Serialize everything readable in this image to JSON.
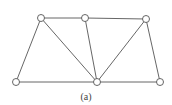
{
  "diagram": {
    "caption": "(a)",
    "colors": {
      "stroke": "#555555",
      "node_fill": "#ffffff",
      "background": "#ffffff"
    },
    "node_radius": 3.5,
    "nodes": [
      {
        "id": "n1",
        "x": 41,
        "y": 18
      },
      {
        "id": "n2",
        "x": 85,
        "y": 18
      },
      {
        "id": "n3",
        "x": 146,
        "y": 19
      },
      {
        "id": "n4",
        "x": 16,
        "y": 82
      },
      {
        "id": "n5",
        "x": 97,
        "y": 82
      },
      {
        "id": "n6",
        "x": 160,
        "y": 82
      }
    ],
    "edges": [
      [
        "n1",
        "n2"
      ],
      [
        "n2",
        "n3"
      ],
      [
        "n4",
        "n5"
      ],
      [
        "n5",
        "n6"
      ],
      [
        "n1",
        "n4"
      ],
      [
        "n1",
        "n5"
      ],
      [
        "n2",
        "n5"
      ],
      [
        "n3",
        "n5"
      ],
      [
        "n3",
        "n6"
      ]
    ]
  }
}
